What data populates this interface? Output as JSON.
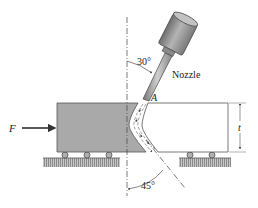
{
  "figure": {
    "labels": {
      "force": "F",
      "point": "A",
      "nozzle": "Nozzle",
      "thickness": "t",
      "angle_top": "30°",
      "angle_bottom": "45°"
    },
    "colors": {
      "block_fill": "#a9a9a9",
      "block_edge": "#555555",
      "ground": "#9a9a9a",
      "nozzle_body": "#8c8c8c",
      "line": "#333333"
    },
    "values": {
      "nozzle_angle_deg": 30,
      "exit_angle_deg": 45
    }
  }
}
